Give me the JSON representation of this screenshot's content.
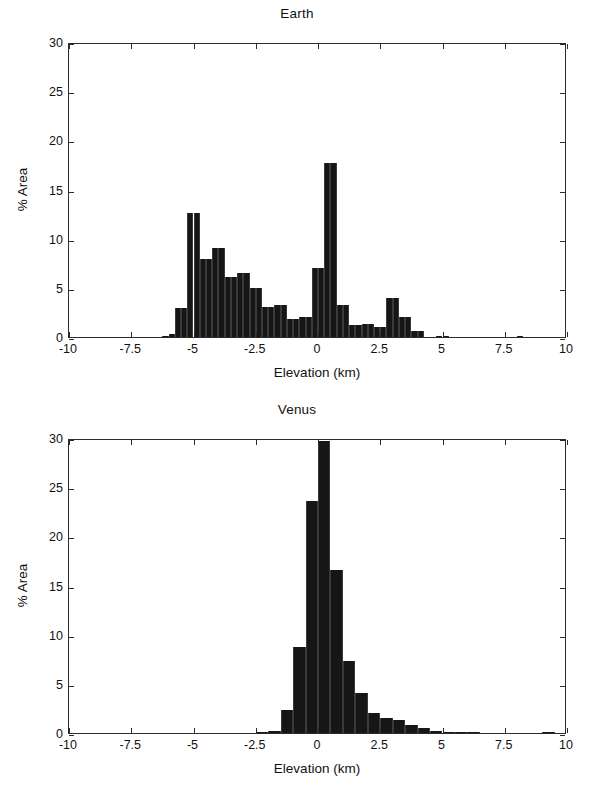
{
  "figure": {
    "panels": [
      "earth",
      "venus"
    ]
  },
  "axis": {
    "xlabel": "Elevation (km)",
    "ylabel": "% Area",
    "xticks": [
      "-10",
      "-7.5",
      "-5",
      "-2.5",
      "0",
      "2.5",
      "5",
      "7.5",
      "10"
    ],
    "xtick_values": [
      -10,
      -7.5,
      -5,
      -2.5,
      0,
      2.5,
      5,
      7.5,
      10
    ],
    "yticks": [
      "0",
      "5",
      "10",
      "15",
      "20",
      "25",
      "30"
    ],
    "ytick_values": [
      0,
      5,
      10,
      15,
      20,
      25,
      30
    ]
  },
  "chart_data": [
    {
      "type": "bar",
      "title": "Earth",
      "xlabel": "Elevation (km)",
      "ylabel": "% Area",
      "xlim": [
        -10,
        10
      ],
      "ylim": [
        0,
        30
      ],
      "grid": false,
      "legend": null,
      "bin_width": 0.25,
      "bar_color": "#161616",
      "x": [
        -6.125,
        -5.875,
        -5.625,
        -5.375,
        -5.125,
        -4.875,
        -4.625,
        -4.375,
        -4.125,
        -3.875,
        -3.625,
        -3.375,
        -3.125,
        -2.875,
        -2.625,
        -2.375,
        -2.125,
        -1.875,
        -1.625,
        -1.375,
        -1.125,
        -0.875,
        -0.625,
        -0.375,
        -0.125,
        0.125,
        0.375,
        0.625,
        0.875,
        1.125,
        1.375,
        1.625,
        1.875,
        2.125,
        2.375,
        2.625,
        2.875,
        3.125,
        3.375,
        3.625,
        3.875,
        4.125,
        4.875,
        5.125,
        8.125
      ],
      "values": [
        0.15,
        0.3,
        3.0,
        3.0,
        12.65,
        12.65,
        7.95,
        7.95,
        9.1,
        9.1,
        6.1,
        6.1,
        6.5,
        6.5,
        5.0,
        5.0,
        3.1,
        3.1,
        3.25,
        3.25,
        1.8,
        1.8,
        2.05,
        2.05,
        7.0,
        7.0,
        17.65,
        17.65,
        3.3,
        3.3,
        1.25,
        1.25,
        1.3,
        1.3,
        1.05,
        1.05,
        3.95,
        3.95,
        2.0,
        2.0,
        0.6,
        0.6,
        0.15,
        0.15,
        0.1
      ]
    },
    {
      "type": "bar",
      "title": "Venus",
      "xlabel": "Elevation (km)",
      "ylabel": "% Area",
      "xlim": [
        -10,
        10
      ],
      "ylim": [
        0,
        30
      ],
      "grid": false,
      "legend": null,
      "bin_width": 0.5,
      "bar_color": "#161616",
      "x": [
        -2.25,
        -1.75,
        -1.25,
        -0.75,
        -0.25,
        0.25,
        0.75,
        1.25,
        1.75,
        2.25,
        2.75,
        3.25,
        3.75,
        4.25,
        4.75,
        5.25,
        5.75,
        6.25,
        9.25
      ],
      "values": [
        0.15,
        0.2,
        2.3,
        8.7,
        23.6,
        29.7,
        16.6,
        7.35,
        4.1,
        2.05,
        1.5,
        1.35,
        0.85,
        0.5,
        0.25,
        0.15,
        0.1,
        0.08,
        0.05
      ]
    }
  ]
}
